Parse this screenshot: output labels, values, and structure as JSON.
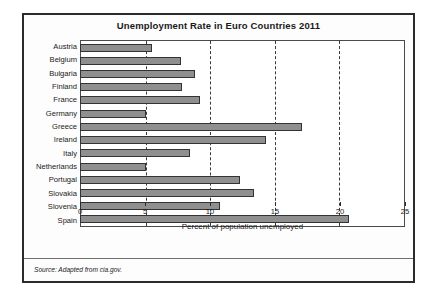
{
  "chart_data": {
    "type": "bar",
    "orientation": "horizontal",
    "title": "Unemployment Rate in Euro Countries 2011",
    "xlabel": "Percent of population unemployed",
    "ylabel": "",
    "xlim": [
      0,
      25
    ],
    "xticks": [
      0,
      5,
      10,
      15,
      20,
      25
    ],
    "xtick_labels": [
      "0",
      "5",
      "10",
      "15",
      "20",
      "25"
    ],
    "grid": "vertical-dashed",
    "legend": "none",
    "categories": [
      "Austria",
      "Belgium",
      "Bulgaria",
      "Finland",
      "France",
      "Germany",
      "Greece",
      "Ireland",
      "Italy",
      "Netherlands",
      "Portugal",
      "Slovakia",
      "Slovenia",
      "Spain"
    ],
    "values": [
      5.6,
      7.8,
      8.9,
      7.9,
      9.3,
      5.1,
      17.2,
      14.4,
      8.5,
      5.1,
      12.4,
      13.5,
      10.8,
      20.8
    ],
    "bar_color": "#8f8f8f",
    "bar_border_color": "#333333"
  },
  "source": {
    "text": "Source: Adapted from cia.gov."
  },
  "frame": {
    "border_color": "#2b2b2b",
    "background": "#fdfdfd"
  }
}
